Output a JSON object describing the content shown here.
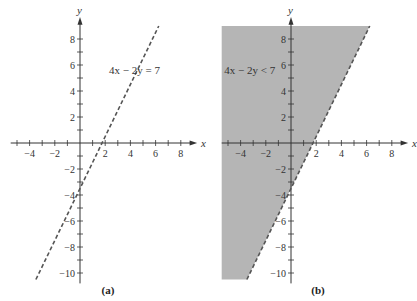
{
  "chart_data": [
    {
      "type": "line",
      "panel": "(a)",
      "title": "",
      "equation_label": "4x − 2y = 7",
      "xlabel": "x",
      "ylabel": "y",
      "xlim": [
        -5.5,
        9
      ],
      "ylim": [
        -10.5,
        9
      ],
      "x_ticks": [
        -4,
        -2,
        2,
        4,
        6,
        8
      ],
      "y_ticks": [
        8,
        6,
        4,
        2,
        -2,
        -4,
        -6,
        -8,
        -10
      ],
      "grid": false,
      "series": [
        {
          "name": "4x - 2y = 7",
          "style": "dashed",
          "x": [
            -3.5,
            6.25
          ],
          "y": [
            -10.5,
            9
          ]
        }
      ]
    },
    {
      "type": "area",
      "panel": "(b)",
      "title": "",
      "equation_label": "4x − 2y < 7",
      "xlabel": "x",
      "ylabel": "y",
      "xlim": [
        -5.5,
        9
      ],
      "ylim": [
        -10.5,
        9
      ],
      "x_ticks": [
        -4,
        -2,
        2,
        4,
        6,
        8
      ],
      "y_ticks": [
        8,
        6,
        4,
        2,
        -2,
        -4,
        -6,
        -8,
        -10
      ],
      "grid": false,
      "series": [
        {
          "name": "boundary 4x - 2y = 7",
          "style": "dashed",
          "x": [
            -3.5,
            6.25
          ],
          "y": [
            -10.5,
            9
          ]
        },
        {
          "name": "shaded region 4x - 2y < 7",
          "fill": "#b3b3b3",
          "polygon": [
            [
              -5.5,
              9
            ],
            [
              6.25,
              9
            ],
            [
              -3.5,
              -10.5
            ],
            [
              -5.5,
              -10.5
            ]
          ]
        }
      ]
    }
  ],
  "panels": {
    "a": {
      "caption": "(a)",
      "equation": "4x − 2y = 7",
      "x_axis": "x",
      "y_axis": "y"
    },
    "b": {
      "caption": "(b)",
      "equation": "4x − 2y < 7",
      "x_axis": "x",
      "y_axis": "y"
    }
  },
  "ticks": {
    "x": [
      "−4",
      "−2",
      "2",
      "4",
      "6",
      "8"
    ],
    "y": [
      "8",
      "6",
      "4",
      "2",
      "−2",
      "−4",
      "−6",
      "−8",
      "−10"
    ]
  },
  "colors": {
    "shade": "#b5b5b5",
    "line": "#555555",
    "axis": "#333333"
  }
}
